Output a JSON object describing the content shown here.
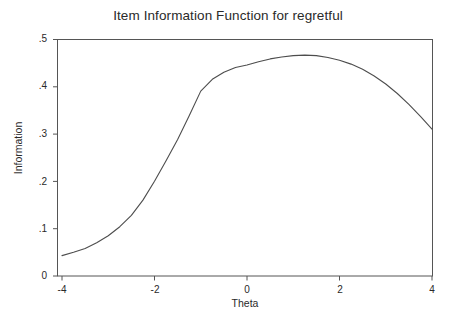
{
  "chart_data": {
    "type": "line",
    "title": "Item Information Function for regretful",
    "xlabel": "Theta",
    "ylabel": "Information",
    "xlim": [
      -4,
      4
    ],
    "ylim": [
      0,
      0.5
    ],
    "grid": false,
    "legend": null,
    "xticks": [
      -4,
      -2,
      0,
      2,
      4
    ],
    "xtick_labels": [
      "-4",
      "-2",
      "0",
      "2",
      "4"
    ],
    "yticks": [
      0,
      0.1,
      0.2,
      0.3,
      0.4,
      0.5
    ],
    "ytick_labels": [
      "0",
      ".1",
      ".2",
      ".3",
      ".4",
      ".5"
    ],
    "series": [
      {
        "name": "Information",
        "color": "#4d4d4d",
        "x": [
          -4.0,
          -3.75,
          -3.5,
          -3.25,
          -3.0,
          -2.75,
          -2.5,
          -2.25,
          -2.0,
          -1.75,
          -1.5,
          -1.25,
          -1.0,
          -0.75,
          -0.5,
          -0.25,
          0.0,
          0.25,
          0.5,
          0.75,
          1.0,
          1.25,
          1.5,
          1.75,
          2.0,
          2.25,
          2.5,
          2.75,
          3.0,
          3.25,
          3.5,
          3.75,
          4.0
        ],
        "values": [
          0.043,
          0.05,
          0.058,
          0.07,
          0.085,
          0.104,
          0.128,
          0.16,
          0.2,
          0.243,
          0.288,
          0.338,
          0.39,
          0.415,
          0.43,
          0.44,
          0.445,
          0.452,
          0.458,
          0.462,
          0.465,
          0.466,
          0.465,
          0.461,
          0.455,
          0.447,
          0.436,
          0.422,
          0.405,
          0.385,
          0.362,
          0.337,
          0.31
        ]
      }
    ]
  },
  "axes": {
    "tick_color": "#555555",
    "frame_color": "#555555"
  }
}
